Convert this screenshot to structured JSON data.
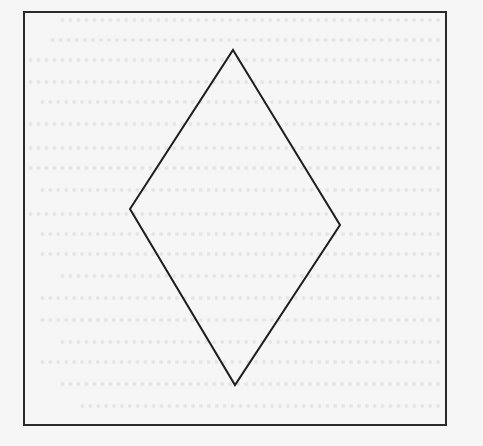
{
  "figure": {
    "frame": {
      "x": 24,
      "y": 12,
      "width": 422,
      "height": 413,
      "stroke": "#2a2a2a",
      "stroke_width": 2
    },
    "rhombus": {
      "points": [
        [
          233,
          50
        ],
        [
          340,
          225
        ],
        [
          235,
          385
        ],
        [
          130,
          209
        ]
      ],
      "stroke": "#1e1e1e",
      "stroke_width": 2,
      "fill": "none"
    },
    "background": "#f6f6f6"
  },
  "bleed_through": {
    "note_color": "#d9d9d9",
    "lines": [
      {
        "y": 18,
        "x": 60
      },
      {
        "y": 38,
        "x": 50
      },
      {
        "y": 58,
        "x": 28
      },
      {
        "y": 80,
        "x": 28
      },
      {
        "y": 100,
        "x": 40
      },
      {
        "y": 122,
        "x": 28
      },
      {
        "y": 146,
        "x": 28
      },
      {
        "y": 166,
        "x": 28
      },
      {
        "y": 188,
        "x": 40
      },
      {
        "y": 212,
        "x": 28
      },
      {
        "y": 232,
        "x": 40
      },
      {
        "y": 252,
        "x": 40
      },
      {
        "y": 274,
        "x": 60
      },
      {
        "y": 296,
        "x": 40
      },
      {
        "y": 318,
        "x": 40
      },
      {
        "y": 340,
        "x": 60
      },
      {
        "y": 360,
        "x": 40
      },
      {
        "y": 382,
        "x": 60
      },
      {
        "y": 404,
        "x": 80
      }
    ]
  }
}
